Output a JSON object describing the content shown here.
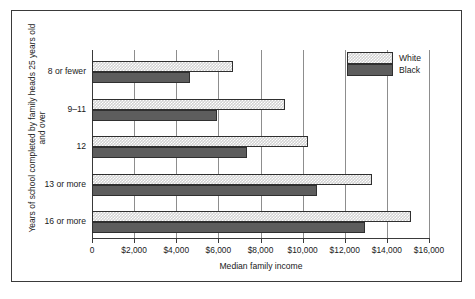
{
  "chart_data": {
    "type": "bar",
    "orientation": "horizontal",
    "title": "",
    "xlabel": "Median family income",
    "ylabel": "Years of school completed by family heads 25 years old and over",
    "ylabel_line1": "Years of school completed by family heads 25 years old",
    "ylabel_line2": "and over",
    "categories": [
      "8 or fewer",
      "9–11",
      "12",
      "13 or more",
      "16 or more"
    ],
    "series": [
      {
        "name": "White",
        "values": [
          6700,
          9170,
          10260,
          13300,
          15150
        ],
        "color": "#d2d2d2",
        "pattern": "checker"
      },
      {
        "name": "Black",
        "values": [
          4650,
          5930,
          7360,
          10690,
          12970
        ],
        "color": "#5d5d5d",
        "pattern": "solid"
      }
    ],
    "xlim": [
      0,
      16000
    ],
    "xticks": [
      0,
      2000,
      4000,
      6000,
      8000,
      10000,
      12000,
      14000,
      16000
    ],
    "xtick_labels": [
      "0",
      "$2,000",
      "$4,000",
      "$6,000",
      "$8,000",
      "$10,000",
      "$12,000",
      "$14,000",
      "$16,000"
    ],
    "grid": "vertical",
    "legend_position": "top-right"
  },
  "legend": {
    "items": [
      {
        "label": "White"
      },
      {
        "label": "Black"
      }
    ]
  },
  "colors": {
    "white_series": "#d2d2d2",
    "black_series": "#5d5d5d",
    "axis": "#3a3a3a",
    "grid": "#8d8d8d",
    "background": "#ffffff"
  }
}
